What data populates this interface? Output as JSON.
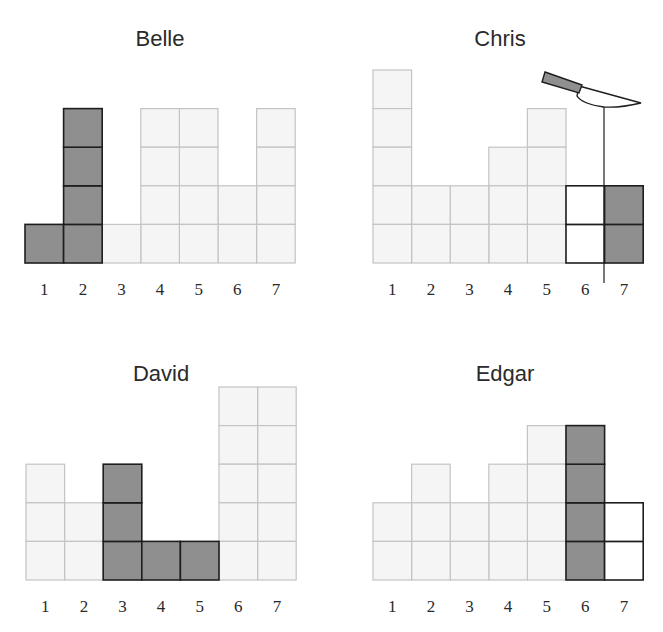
{
  "figure": {
    "legend": {
      "light": "existing block",
      "dark": "highlighted block",
      "empty": "removed / outlined block"
    },
    "colors": {
      "light_fill": "#f5f5f5",
      "light_stroke": "#c4c4c4",
      "dark_fill": "#8f8f8f",
      "dark_stroke": "#1e1e1e",
      "empty_fill": "#ffffff"
    },
    "column_labels": [
      "1",
      "2",
      "3",
      "4",
      "5",
      "6",
      "7"
    ],
    "panels": [
      {
        "name": "Belle",
        "columns": [
          {
            "label": "1",
            "height": 1,
            "style": "dark"
          },
          {
            "label": "2",
            "height": 4,
            "style": "dark"
          },
          {
            "label": "3",
            "height": 1,
            "style": "light"
          },
          {
            "label": "4",
            "height": 4,
            "style": "light"
          },
          {
            "label": "5",
            "height": 4,
            "style": "light"
          },
          {
            "label": "6",
            "height": 2,
            "style": "light"
          },
          {
            "label": "7",
            "height": 4,
            "style": "light"
          }
        ],
        "knife": null
      },
      {
        "name": "Chris",
        "columns": [
          {
            "label": "1",
            "height": 5,
            "style": "light"
          },
          {
            "label": "2",
            "height": 2,
            "style": "light"
          },
          {
            "label": "3",
            "height": 2,
            "style": "light"
          },
          {
            "label": "4",
            "height": 3,
            "style": "light"
          },
          {
            "label": "5",
            "height": 4,
            "style": "light"
          },
          {
            "label": "6",
            "height": 2,
            "style": "empty"
          },
          {
            "label": "7",
            "height": 2,
            "style": "dark"
          }
        ],
        "knife": {
          "icon": "knife-icon",
          "cut_between": [
            "6",
            "7"
          ]
        }
      },
      {
        "name": "David",
        "columns": [
          {
            "label": "1",
            "height": 3,
            "style": "light"
          },
          {
            "label": "2",
            "height": 2,
            "style": "light"
          },
          {
            "label": "3",
            "height": 3,
            "style": "dark"
          },
          {
            "label": "4",
            "height": 1,
            "style": "dark"
          },
          {
            "label": "5",
            "height": 1,
            "style": "dark"
          },
          {
            "label": "6",
            "height": 5,
            "style": "light"
          },
          {
            "label": "7",
            "height": 5,
            "style": "light"
          }
        ],
        "knife": null
      },
      {
        "name": "Edgar",
        "columns": [
          {
            "label": "1",
            "height": 2,
            "style": "light"
          },
          {
            "label": "2",
            "height": 3,
            "style": "light"
          },
          {
            "label": "3",
            "height": 2,
            "style": "light"
          },
          {
            "label": "4",
            "height": 3,
            "style": "light"
          },
          {
            "label": "5",
            "height": 4,
            "style": "light"
          },
          {
            "label": "6",
            "height": 4,
            "style": "dark"
          },
          {
            "label": "7",
            "height": 2,
            "style": "empty"
          }
        ],
        "knife": null
      }
    ]
  }
}
